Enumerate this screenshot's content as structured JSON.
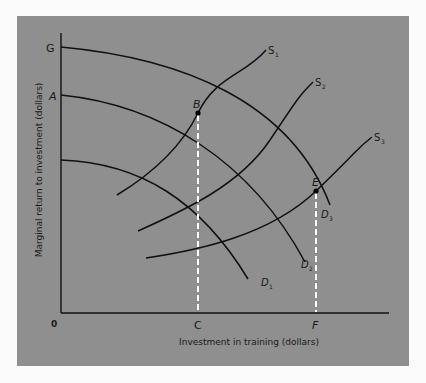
{
  "diagram": {
    "type": "economics-supply-demand",
    "background_color": "#8f8f8f",
    "line_color": "#111111",
    "dashed_line_color": "#ffffff",
    "x_axis_label": "Investment in training (dollars)",
    "y_axis_label": "Marginal return to investment (dollars)",
    "origin_label": "0",
    "y_axis_points": [
      "G",
      "A"
    ],
    "x_axis_points": [
      "C",
      "F"
    ],
    "points": {
      "B": "B",
      "E": "E"
    },
    "demand_curves": [
      {
        "name": "D",
        "sub": "1"
      },
      {
        "name": "D",
        "sub": "2"
      },
      {
        "name": "D",
        "sub": "3"
      }
    ],
    "supply_curves": [
      {
        "name": "S",
        "sub": "1"
      },
      {
        "name": "S",
        "sub": "2"
      },
      {
        "name": "S",
        "sub": "3"
      }
    ]
  }
}
